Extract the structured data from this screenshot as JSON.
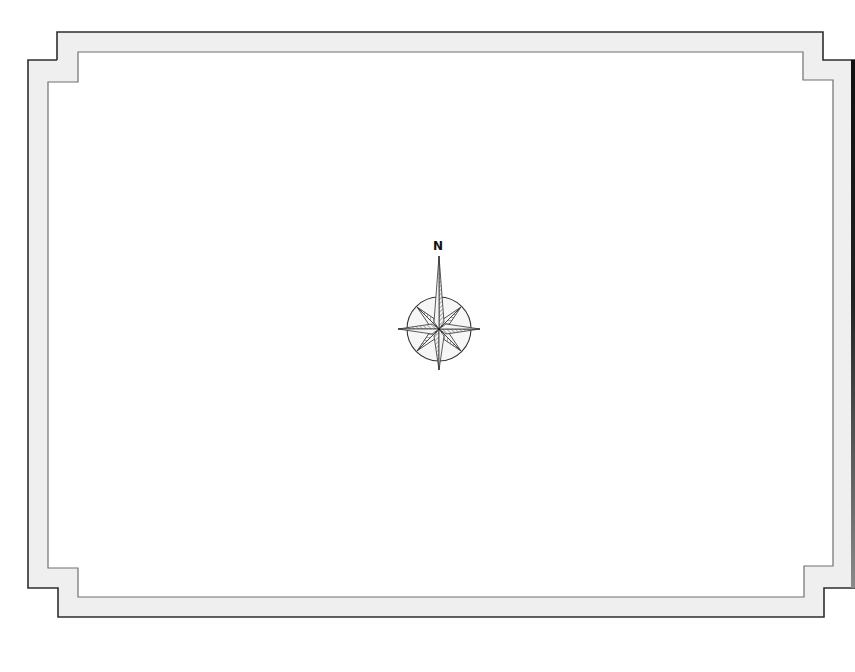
{
  "map": {
    "type": "blank-map-template",
    "background_color": "#ffffff",
    "frame": {
      "fill_color": "#efefef",
      "outer_stroke_color": "#2e2e2e",
      "inner_stroke_color": "#707070",
      "right_edge_shadow_color": "#111111"
    },
    "compass": {
      "north_label": "N",
      "center_x": 439,
      "center_y": 329,
      "ring_radius": 32,
      "stroke_color": "#333333",
      "fill_color": "#f4f4f4",
      "hatch_color": "#555555"
    }
  }
}
